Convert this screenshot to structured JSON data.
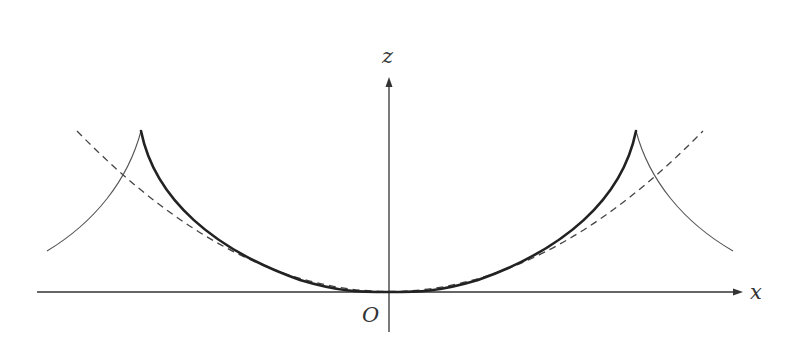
{
  "diagram": {
    "type": "geometric-curve-plot",
    "axes": {
      "horizontal_label": "x",
      "vertical_label": "z",
      "origin_label": "O"
    },
    "curves": [
      {
        "name": "central-bowl-curve",
        "style": "thick solid",
        "description": "U-shaped curve tangent to x-axis at O, ending in cusps on both sides"
      },
      {
        "name": "outer-branch-left",
        "style": "thin solid",
        "description": "branch descending outward from left cusp"
      },
      {
        "name": "outer-branch-right",
        "style": "thin solid",
        "description": "branch descending outward from right cusp"
      },
      {
        "name": "reference-parabola",
        "style": "dashed",
        "description": "dashed parabola touching bowl near the bottom and extending past the cusps"
      }
    ],
    "colors": {
      "ink": "#222222",
      "axis": "#333333",
      "background": "#ffffff"
    }
  }
}
